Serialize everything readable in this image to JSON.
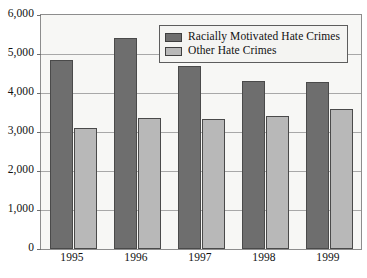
{
  "chart_data": {
    "type": "bar",
    "title": "",
    "subtitle": "",
    "xlabel": "",
    "ylabel": "",
    "categories": [
      "1995",
      "1996",
      "1997",
      "1998",
      "1999"
    ],
    "series": [
      {
        "name": "Racially Motivated Hate Crimes",
        "color": "#6e6e6e",
        "values": [
          4850,
          5400,
          4700,
          4300,
          4280
        ]
      },
      {
        "name": "Other Hate Crimes",
        "color": "#b8b8b8",
        "values": [
          3100,
          3360,
          3340,
          3400,
          3580
        ]
      }
    ],
    "ylim": [
      0,
      6000
    ],
    "ytick_values": [
      0,
      1000,
      2000,
      3000,
      4000,
      5000,
      6000
    ],
    "ytick_labels": [
      "0",
      "1,000",
      "2,000",
      "3,000",
      "4,000",
      "5,000",
      "6,000"
    ],
    "grid": true,
    "legend_position": "top-right-inside",
    "orientation": "vertical",
    "grouped": true
  },
  "legend": {
    "entries": [
      {
        "label": "Racially Motivated Hate Crimes",
        "swatch": "legend-swatch-dark"
      },
      {
        "label": "Other Hate Crimes",
        "swatch": "legend-swatch-light"
      }
    ]
  },
  "colors": {
    "series_dark": "#6e6e6e",
    "series_light": "#b8b8b8",
    "plot_background": "#f7f7f5",
    "axis_border": "#8d8d8d",
    "gridline": "#a8a8a8",
    "bar_outline": "#4a4a4a",
    "page_background": "#ffffff",
    "text": "#111111"
  }
}
